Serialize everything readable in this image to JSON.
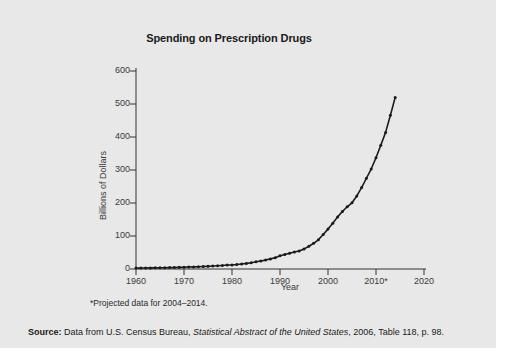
{
  "figure": {
    "title": "Spending on Prescription Drugs",
    "footnote": "*Projected data for 2004–2014.",
    "source": {
      "prefix": "Source:",
      "text_before": " Data from U.S. Census Bureau, ",
      "italic": "Statistical Abstract of the United States",
      "text_after": ", 2006, Table 118, p. 98."
    }
  },
  "chart_data": {
    "type": "line",
    "title": "Spending on Prescription Drugs",
    "xlabel": "Year",
    "ylabel": "Billions of Dollars",
    "xlim": [
      1960,
      2020
    ],
    "ylim": [
      0,
      600
    ],
    "xticks": [
      1960,
      1970,
      1980,
      1990,
      2000,
      2010,
      2020
    ],
    "xtick_labels": [
      "1960",
      "1970",
      "1980",
      "1990",
      "2000",
      "2010*",
      "2020"
    ],
    "yticks": [
      0,
      100,
      200,
      300,
      400,
      500,
      600
    ],
    "ytick_labels": [
      "0",
      "100",
      "200",
      "300",
      "400",
      "500",
      "600"
    ],
    "grid": false,
    "legend": null,
    "marker": "dot",
    "line_color": "#1a1a1a",
    "series": [
      {
        "name": "Prescription drug spending",
        "x": [
          1960,
          1961,
          1962,
          1963,
          1964,
          1965,
          1966,
          1967,
          1968,
          1969,
          1970,
          1971,
          1972,
          1973,
          1974,
          1975,
          1976,
          1977,
          1978,
          1979,
          1980,
          1981,
          1982,
          1983,
          1984,
          1985,
          1986,
          1987,
          1988,
          1989,
          1990,
          1991,
          1992,
          1993,
          1994,
          1995,
          1996,
          1997,
          1998,
          1999,
          2000,
          2001,
          2002,
          2003,
          2004,
          2005,
          2006,
          2007,
          2008,
          2009,
          2010,
          2011,
          2012,
          2013,
          2014
        ],
        "values": [
          2.7,
          2.9,
          3.1,
          3.3,
          3.5,
          3.7,
          4.0,
          4.3,
          4.6,
          5.0,
          5.5,
          5.9,
          6.3,
          6.8,
          7.4,
          8.1,
          8.9,
          9.8,
          10.8,
          12.0,
          12.0,
          13.5,
          15.0,
          17.0,
          19.0,
          21.8,
          24.3,
          27.0,
          30.6,
          34.3,
          40.3,
          44.0,
          48.0,
          51.3,
          54.6,
          60.8,
          68.6,
          77.9,
          88.5,
          104.4,
          120.9,
          138.6,
          157.9,
          174.2,
          188.5,
          200.7,
          221.4,
          246.8,
          275.0,
          303.0,
          337.0,
          375.0,
          414.0,
          466.0,
          520.0
        ]
      }
    ]
  }
}
